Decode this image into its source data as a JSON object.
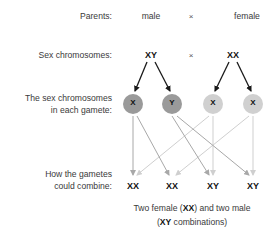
{
  "labels": {
    "parents": "Parents:",
    "sex_chromosomes": "Sex chromosomes:",
    "gametes_line1": "The sex chromosomes",
    "gametes_line2": "in each gamete:",
    "combine_line1": "How the gametes",
    "combine_line2": "could combine:"
  },
  "parents": {
    "left": "male",
    "cross": "×",
    "right": "female"
  },
  "chromosomes": {
    "left": "XY",
    "cross": "×",
    "right": "XX"
  },
  "gametes": [
    {
      "label": "X",
      "parent": "male",
      "color": "#9a9a9a"
    },
    {
      "label": "Y",
      "parent": "male",
      "color": "#9a9a9a"
    },
    {
      "label": "X",
      "parent": "female",
      "color": "#d0d0d0"
    },
    {
      "label": "X",
      "parent": "female",
      "color": "#d0d0d0"
    }
  ],
  "combinations": [
    "XX",
    "XX",
    "XY",
    "XY"
  ],
  "caption": {
    "p1": "Two female (",
    "b1": "XX",
    "p2": ") and two male",
    "p3": "(",
    "b2": "XY",
    "p4": " combinations)"
  },
  "colors": {
    "male_gamete": "#9a9a9a",
    "female_gamete": "#d0d0d0",
    "male_arrow": "#a8a8a8",
    "female_arrow": "#cfcfcf",
    "parent_arrow": "#1a1a1a"
  }
}
